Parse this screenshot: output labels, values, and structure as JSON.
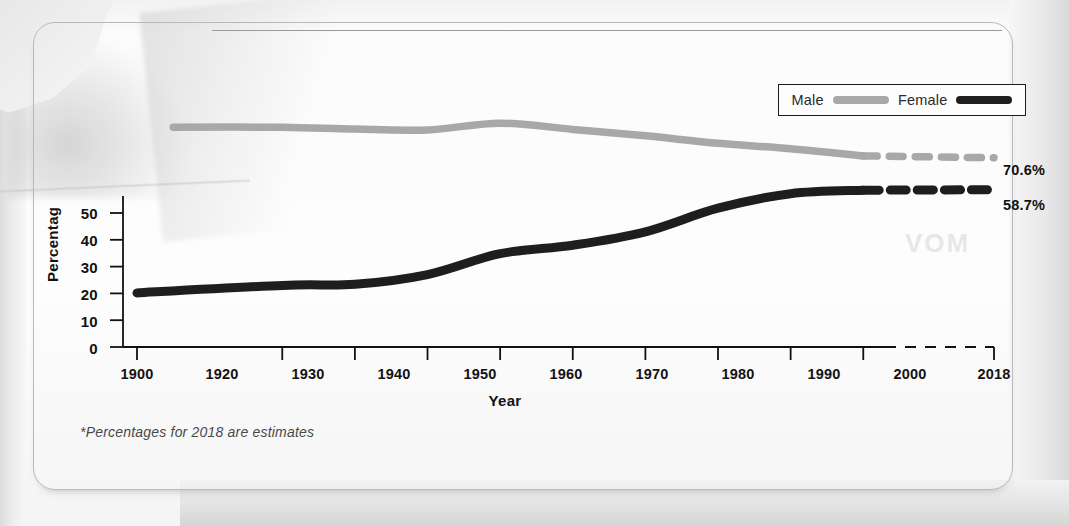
{
  "chart_data": {
    "type": "line",
    "title": "",
    "xlabel": "Year",
    "ylabel": "Percentage",
    "ylabel_visible": "Percentag",
    "xlim": [
      1900,
      2018
    ],
    "ylim": [
      0,
      90
    ],
    "y_ticks": [
      "50",
      "40",
      "30",
      "20",
      "10",
      "0"
    ],
    "y_tick_values": [
      50,
      40,
      30,
      20,
      10,
      0
    ],
    "x_ticks": [
      "1900",
      "1920",
      "1930",
      "1940",
      "1950",
      "1960",
      "1970",
      "1980",
      "1990",
      "2000",
      "2018"
    ],
    "x_tick_values": [
      1900,
      1920,
      1930,
      1940,
      1950,
      1960,
      1970,
      1980,
      1990,
      2000,
      2018
    ],
    "grid": false,
    "legend_position": "top-right",
    "x": [
      1900,
      1920,
      1930,
      1940,
      1950,
      1960,
      1970,
      1980,
      1990,
      2000,
      2018
    ],
    "series": [
      {
        "name": "Male",
        "color": "#a8a8a8",
        "values": [
          null,
          82.0,
          81.3,
          81.0,
          83.5,
          81.2,
          78.8,
          76.0,
          74.0,
          71.3,
          70.6
        ],
        "solid_until": 2000,
        "dashed_from": 2000,
        "end_label": "70.6%",
        "start_year": 1905,
        "start_value": 82.0
      },
      {
        "name": "Female",
        "color": "#1e1e1e",
        "values": [
          20.2,
          23.0,
          23.4,
          27.0,
          34.8,
          38.0,
          43.0,
          51.8,
          57.2,
          58.5,
          58.7
        ],
        "solid_until": 2000,
        "dashed_from": 2000,
        "end_label": "58.7%"
      }
    ],
    "annotations": [
      "*Percentages for 2018 are estimates"
    ]
  },
  "legend": {
    "items": [
      {
        "label": "Male",
        "color": "#a8a8a8"
      },
      {
        "label": "Female",
        "color": "#1e1e1e"
      }
    ]
  },
  "axis": {
    "y_title": "Percentag",
    "x_title": "Year",
    "y_ticks": [
      "50",
      "40",
      "30",
      "20",
      "10",
      "0"
    ],
    "x_ticks": [
      "1900",
      "1920",
      "1930",
      "1940",
      "1950",
      "1960",
      "1970",
      "1980",
      "1990",
      "2000",
      "2018"
    ]
  },
  "end_labels": {
    "male": "70.6%",
    "female": "58.7%"
  },
  "footnote": "*Percentages for 2018 are estimates",
  "colors": {
    "male_line": "#a8a8a8",
    "female_line": "#1e1e1e",
    "axis": "#111111",
    "card_border": "#b9b9b9",
    "paper": "#fdfdfd"
  }
}
